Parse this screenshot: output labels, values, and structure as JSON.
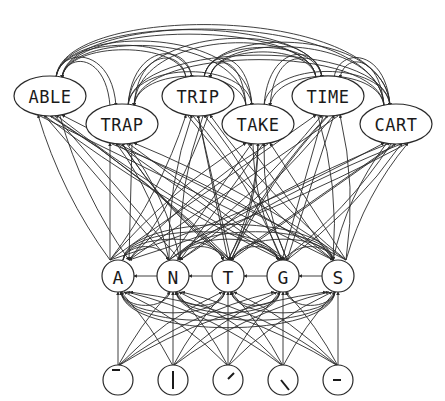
{
  "diagram": {
    "type": "interactive-activation-network",
    "layers": {
      "words": [
        {
          "id": "ABLE",
          "label": "ABLE",
          "x": 50,
          "y": 96,
          "rx": 36,
          "ry": 20
        },
        {
          "id": "TRAP",
          "label": "TRAP",
          "x": 122,
          "y": 124,
          "rx": 36,
          "ry": 20
        },
        {
          "id": "TRIP",
          "label": "TRIP",
          "x": 198,
          "y": 96,
          "rx": 36,
          "ry": 20
        },
        {
          "id": "TAKE",
          "label": "TAKE",
          "x": 258,
          "y": 124,
          "rx": 36,
          "ry": 20
        },
        {
          "id": "TIME",
          "label": "TIME",
          "x": 328,
          "y": 96,
          "rx": 36,
          "ry": 20
        },
        {
          "id": "CART",
          "label": "CART",
          "x": 396,
          "y": 124,
          "rx": 36,
          "ry": 20
        }
      ],
      "letters": [
        {
          "id": "A",
          "label": "A",
          "x": 118,
          "y": 276,
          "r": 16
        },
        {
          "id": "N",
          "label": "N",
          "x": 173,
          "y": 276,
          "r": 16
        },
        {
          "id": "T",
          "label": "T",
          "x": 228,
          "y": 276,
          "r": 16
        },
        {
          "id": "G",
          "label": "G",
          "x": 283,
          "y": 276,
          "r": 16
        },
        {
          "id": "S",
          "label": "S",
          "x": 338,
          "y": 276,
          "r": 16
        }
      ],
      "features": [
        {
          "id": "f-top-bar",
          "glyph": "horizontal bar (top)",
          "x": 118,
          "y": 380,
          "r": 15,
          "bar": [
            -6,
            -10,
            2,
            -10
          ]
        },
        {
          "id": "f-vertical-bar",
          "glyph": "vertical bar",
          "x": 173,
          "y": 380,
          "r": 15,
          "bar": [
            0,
            -9,
            0,
            9
          ]
        },
        {
          "id": "f-diagonal-up",
          "glyph": "diagonal bar (rising)",
          "x": 228,
          "y": 380,
          "r": 15,
          "bar": [
            0,
            -1,
            6,
            -7
          ]
        },
        {
          "id": "f-diagonal-down",
          "glyph": "diagonal bar (falling)",
          "x": 283,
          "y": 380,
          "r": 15,
          "bar": [
            -2,
            0,
            6,
            10
          ]
        },
        {
          "id": "f-middle-bar",
          "glyph": "horizontal bar (middle)",
          "x": 338,
          "y": 380,
          "r": 15,
          "bar": [
            -5,
            0,
            3,
            0
          ]
        }
      ]
    },
    "colors": {
      "stroke": "#2a2a2a",
      "fill": "#ffffff",
      "text": "#1a1a1a",
      "background": "#ffffff"
    }
  }
}
